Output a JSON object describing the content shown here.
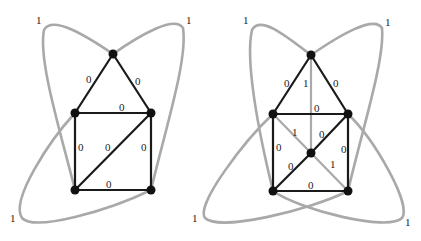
{
  "colors": {
    "tree_edge": "#1a1a1a",
    "nontree_edge": "#a9a9a9",
    "node": "#111111",
    "label": "#222222"
  },
  "graphs": [
    {
      "name": "left",
      "edge_labels": {
        "top_left": "0",
        "top_right": "0",
        "mid_top": "0",
        "left_vertical": "0",
        "diagonal": "0",
        "right_vertical": "0",
        "bottom": "0",
        "loop_top_left": "1",
        "loop_top_right": "1",
        "loop_bottom_left": "1"
      }
    },
    {
      "name": "right",
      "edge_labels": {
        "top_left": "0",
        "top_center": "1",
        "top_right": "0",
        "mid_top": "0",
        "cross_upper_left": "1",
        "diag_upper": "0",
        "left_vertical": "0",
        "right_vertical": "0",
        "diag_lower": "0",
        "cross_lower_right": "1",
        "bottom": "0",
        "loop_top_left": "1",
        "loop_top_right": "1",
        "loop_bottom_left": "1",
        "loop_bottom_right": "1"
      }
    }
  ]
}
